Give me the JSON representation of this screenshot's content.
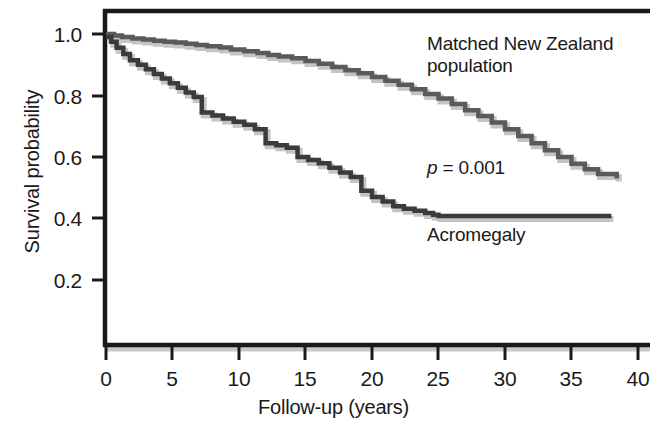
{
  "figure": {
    "name": "survival-curve-figure",
    "background": "#ffffff",
    "line_color_acromegaly": "#3b3b3b",
    "line_color_population": "#5a5a5a",
    "axis_color": "#1a1a1a"
  },
  "axes": {
    "y_title": "Survival probability",
    "x_title": "Follow-up (years)",
    "y_ticks": [
      "1.0",
      "0.8",
      "0.6",
      "0.4",
      "0.2"
    ],
    "y_tick_values": [
      1.0,
      0.8,
      0.6,
      0.4,
      0.2
    ],
    "x_ticks": [
      "0",
      "5",
      "10",
      "15",
      "20",
      "25",
      "30",
      "35",
      "40"
    ],
    "x_tick_values": [
      0,
      5,
      10,
      15,
      20,
      25,
      30,
      35,
      40
    ]
  },
  "annotations": {
    "population_label": "Matched New Zealand\npopulation",
    "p_value_symbol": "p",
    "p_value_rest": " = 0.001",
    "acromegaly_label": "Acromegaly"
  },
  "chart_data": {
    "type": "line",
    "title": "",
    "subtitle": "",
    "xlabel": "Follow-up (years)",
    "ylabel": "Survival probability",
    "xlim": [
      0,
      41
    ],
    "ylim": [
      0,
      1.06
    ],
    "grid": false,
    "legend": "inline-annotations",
    "annotations": [
      {
        "text": "Matched New Zealand population",
        "x": 24.0,
        "y": 0.96
      },
      {
        "text": "p = 0.001",
        "x": 24.0,
        "y": 0.555
      },
      {
        "text": "Acromegaly",
        "x": 24.0,
        "y": 0.335
      }
    ],
    "series": [
      {
        "name": "Matched New Zealand population",
        "color": "#5a5a5a",
        "step": "post",
        "x": [
          0.0,
          0.6,
          1.2,
          2.0,
          2.8,
          3.6,
          4.4,
          5.2,
          6.0,
          6.8,
          7.6,
          8.6,
          9.4,
          10.4,
          11.4,
          12.2,
          13.0,
          14.0,
          15.0,
          16.0,
          17.0,
          18.0,
          19.0,
          20.0,
          21.0,
          22.0,
          23.0,
          24.0,
          25.0,
          26.0,
          27.0,
          28.0,
          29.0,
          30.0,
          31.0,
          32.0,
          33.0,
          34.0,
          35.0,
          36.0,
          37.0,
          38.4
        ],
        "y": [
          1.0,
          0.995,
          0.99,
          0.985,
          0.982,
          0.978,
          0.975,
          0.972,
          0.968,
          0.964,
          0.96,
          0.956,
          0.95,
          0.944,
          0.938,
          0.932,
          0.927,
          0.921,
          0.912,
          0.903,
          0.893,
          0.882,
          0.872,
          0.86,
          0.848,
          0.835,
          0.82,
          0.805,
          0.79,
          0.772,
          0.752,
          0.733,
          0.712,
          0.69,
          0.668,
          0.645,
          0.622,
          0.6,
          0.578,
          0.56,
          0.545,
          0.53
        ]
      },
      {
        "name": "Acromegaly",
        "color": "#3b3b3b",
        "step": "post",
        "x": [
          0.0,
          0.4,
          0.8,
          1.3,
          1.8,
          2.4,
          3.0,
          3.6,
          4.2,
          4.8,
          5.4,
          6.0,
          6.6,
          7.2,
          7.2,
          8.0,
          8.8,
          9.6,
          10.4,
          11.2,
          12.0,
          12.0,
          12.8,
          13.6,
          14.4,
          14.4,
          15.2,
          16.0,
          16.8,
          17.6,
          18.4,
          19.2,
          19.2,
          20.0,
          20.8,
          21.6,
          22.4,
          23.2,
          24.0,
          24.6,
          25.0,
          38.0
        ],
        "y": [
          0.99,
          0.975,
          0.955,
          0.935,
          0.915,
          0.9,
          0.885,
          0.87,
          0.855,
          0.84,
          0.825,
          0.81,
          0.795,
          0.78,
          0.745,
          0.735,
          0.725,
          0.715,
          0.705,
          0.69,
          0.675,
          0.645,
          0.638,
          0.63,
          0.622,
          0.6,
          0.59,
          0.58,
          0.565,
          0.55,
          0.535,
          0.52,
          0.49,
          0.47,
          0.455,
          0.44,
          0.432,
          0.425,
          0.418,
          0.412,
          0.408,
          0.408
        ]
      }
    ]
  }
}
